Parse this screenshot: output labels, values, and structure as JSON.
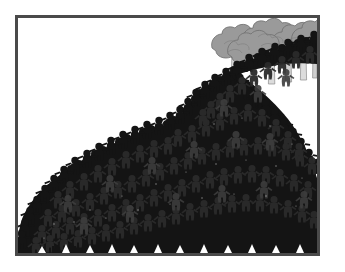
{
  "image": {
    "kind": "illustration",
    "title": "Crowd of figures streaming out from a grove of trees",
    "caption": "A dense black silhouetted crowd of small human figures flows from behind a row of gray trees at the upper right and spreads across the lower left of the frame.",
    "background_color": "#ffffff",
    "frame": {
      "name": "picture-border",
      "color": "#4a4a4a",
      "thickness_px": 3,
      "x": 15,
      "y": 15,
      "width": 305,
      "height": 241
    }
  },
  "palette": {
    "crowd_dark": "#141414",
    "crowd_shade": "#262626",
    "crowd_highlight": "#3a3a3a",
    "tree_canopy": "#9a9a9a",
    "tree_canopy_shade": "#8a8a8a",
    "tree_canopy_outline": "#6f6f6f",
    "tree_trunk": "#d9d9d9",
    "tree_trunk_shade": "#bdbdbd",
    "tree_trunk_outline": "#8d8d8d",
    "paper_white": "#ffffff",
    "frame_gray": "#4a4a4a"
  },
  "scene": {
    "viewbox": "0 0 299 235",
    "trees": {
      "name": "tree-row",
      "count": 6,
      "canopy_color": "#9a9a9a",
      "trunk_color": "#d9d9d9",
      "canopies": [
        {
          "cx": 222,
          "cy": 26,
          "rx": 26,
          "ry": 18
        },
        {
          "cx": 250,
          "cy": 20,
          "rx": 26,
          "ry": 18
        },
        {
          "cx": 276,
          "cy": 24,
          "rx": 25,
          "ry": 18
        },
        {
          "cx": 298,
          "cy": 20,
          "rx": 24,
          "ry": 17
        }
      ],
      "trunks": [
        {
          "x": 215,
          "y": 38,
          "w": 6,
          "h": 30
        },
        {
          "x": 233,
          "y": 36,
          "w": 6,
          "h": 32
        },
        {
          "x": 252,
          "y": 34,
          "w": 6,
          "h": 32
        },
        {
          "x": 268,
          "y": 36,
          "w": 6,
          "h": 30
        },
        {
          "x": 283,
          "y": 34,
          "w": 6,
          "h": 28
        },
        {
          "x": 295,
          "y": 36,
          "w": 6,
          "h": 26
        }
      ]
    },
    "crowd": {
      "name": "crowd-mass",
      "color": "#141414",
      "description": "A river of tiny human silhouettes curving from the upper-right tree line, bending left and broadening into a wide mound that fills the bottom-left of the plate.",
      "outline_path": "M299,44 L299,22 L240,36 L214,48 L196,58 L180,64 L168,70 L158,80 L150,94 L140,104 L126,110 L110,118 L94,126 L78,136 L62,146 L46,156 L32,168 L20,180 L10,194 L2,208 L0,235 L299,235 Z",
      "figure_count_estimate": 900
    }
  },
  "alt_text": "Black-and-white illustration: a huge crowd of tiny black human figures pours out from under a row of gray trees in the upper right corner and fans out diagonally across the picture, filling the lower-left two thirds of a thin dark-gray rectangular frame on a white background."
}
